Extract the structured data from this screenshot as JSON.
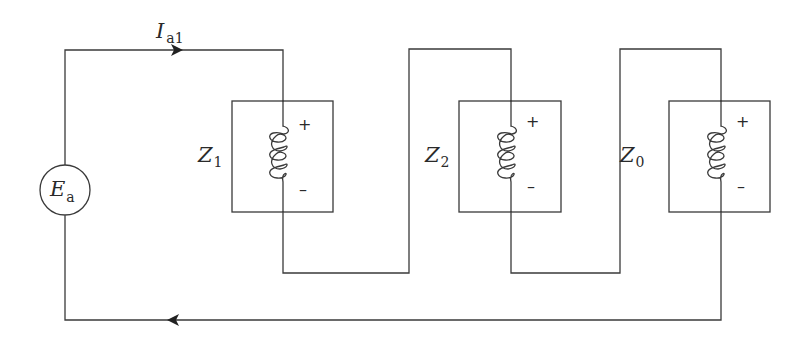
{
  "diagram": {
    "type": "circuit",
    "source": {
      "label": "E",
      "subscript": "a"
    },
    "current": {
      "label": "I",
      "subscript": "a1",
      "direction_top": "right",
      "direction_bottom": "left"
    },
    "impedances": [
      {
        "label": "Z",
        "subscript": "1",
        "plus": "+",
        "minus": "–"
      },
      {
        "label": "Z",
        "subscript": "2",
        "plus": "+",
        "minus": "–"
      },
      {
        "label": "Z",
        "subscript": "0",
        "plus": "+",
        "minus": "–"
      }
    ],
    "colors": {
      "line": "#3a3a3a",
      "text": "#2a2a2a",
      "background": "#ffffff"
    }
  }
}
